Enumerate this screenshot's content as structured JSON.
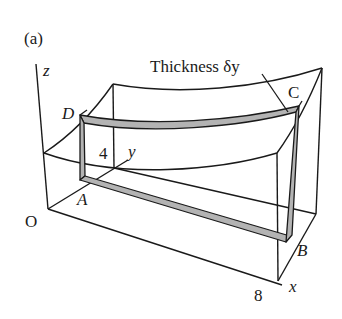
{
  "figure": {
    "panel_label": "(a)",
    "thickness_label": "Thickness δy",
    "points": {
      "O": "O",
      "A": "A",
      "B": "B",
      "C": "C",
      "D": "D"
    },
    "axes": {
      "x": "x",
      "y": "y",
      "z": "z"
    },
    "ticks": {
      "x_max": "8",
      "y_max": "4"
    },
    "colors": {
      "line": "#1a1a1a",
      "slab_fill": "#b3b3b3",
      "background": "#ffffff"
    }
  }
}
